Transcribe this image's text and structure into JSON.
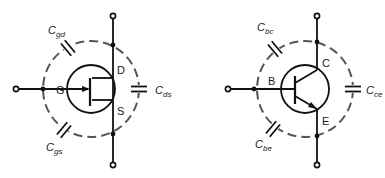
{
  "diagrams": [
    {
      "name": "MOSFET parasitic capacitances",
      "terminals": {
        "gate": "G",
        "drain": "D",
        "source": "S"
      },
      "capacitors": [
        {
          "id": "gd",
          "main": "C",
          "sub": "gd"
        },
        {
          "id": "ds",
          "main": "C",
          "sub": "ds"
        },
        {
          "id": "gs",
          "main": "C",
          "sub": "gs"
        }
      ]
    },
    {
      "name": "BJT parasitic capacitances",
      "terminals": {
        "base": "B",
        "collector": "C",
        "emitter": "E"
      },
      "capacitors": [
        {
          "id": "bc",
          "main": "C",
          "sub": "bc"
        },
        {
          "id": "ce",
          "main": "C",
          "sub": "ce"
        },
        {
          "id": "be",
          "main": "C",
          "sub": "be"
        }
      ]
    }
  ],
  "colors": {
    "line": "#111111",
    "dashed": "#555555",
    "background": "#ffffff"
  }
}
